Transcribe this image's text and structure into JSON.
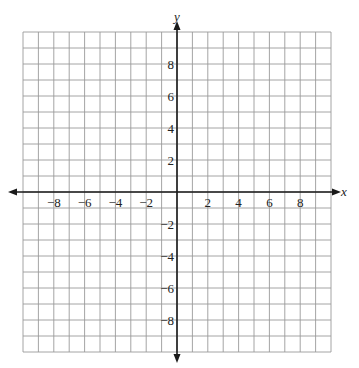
{
  "chart_data": {
    "type": "coordinate-grid",
    "title": "",
    "xlabel": "x",
    "ylabel": "y",
    "xlim": [
      -10,
      10
    ],
    "ylim": [
      -10,
      10
    ],
    "grid": true,
    "grid_step": 1,
    "x_ticks": [
      -8,
      -6,
      -4,
      -2,
      2,
      4,
      6,
      8
    ],
    "y_ticks": [
      8,
      6,
      4,
      2,
      -2,
      -4,
      -6,
      -8
    ],
    "x_tick_labels": [
      "−8",
      "−6",
      "−4",
      "−2",
      "2",
      "4",
      "6",
      "8"
    ],
    "y_tick_labels": [
      "8",
      "6",
      "4",
      "2",
      "−2",
      "−4",
      "−6",
      "−8"
    ],
    "series": [],
    "colors": {
      "grid": "#9a9a9a",
      "axis": "#1a1a1a",
      "background": "#ffffff"
    }
  }
}
